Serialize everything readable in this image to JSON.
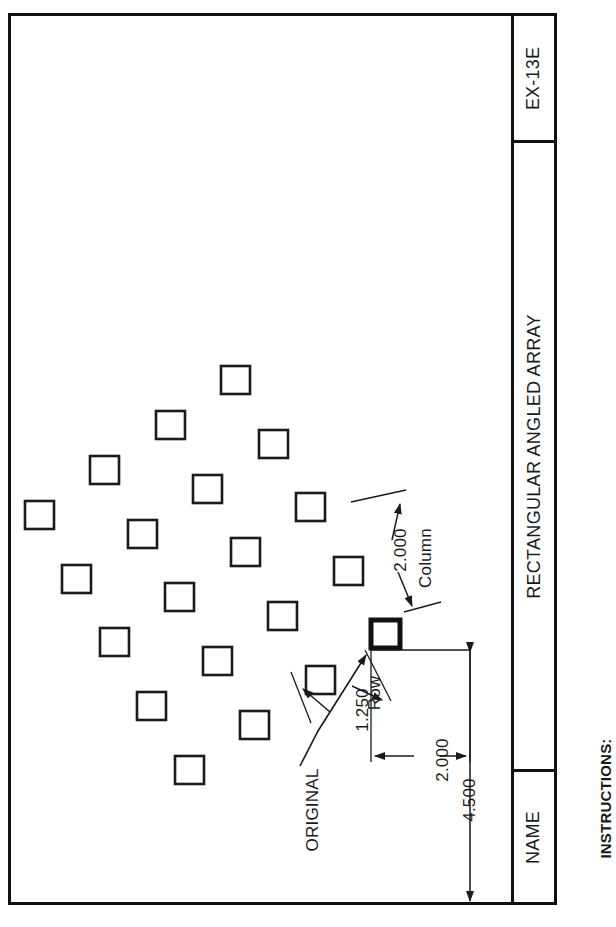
{
  "sheet": {
    "title_block": {
      "drawing_number": "EX-13E",
      "drawing_title": "RECTANGULAR ANGLED ARRAY",
      "name_label": "NAME"
    },
    "instructions_label": "INSTRUCTIONS:"
  },
  "annotations": {
    "original_label": "ORIGINAL",
    "column_spacing": "2.000",
    "column_word": "Column",
    "row_spacing": "1.250",
    "row_word": "Row",
    "offset_dimension": "2.000",
    "overall_dimension": "4.500"
  },
  "chart_data": {
    "type": "scatter",
    "title": "RECTANGULAR ANGLED ARRAY",
    "xlabel": "",
    "ylabel": "",
    "array": {
      "rows": 4,
      "columns": 5,
      "row_spacing": 1.25,
      "column_spacing": 2.0,
      "base_point": "ORIGINAL",
      "angle_note": "array rotated / angled relative to sheet axes"
    },
    "squares_px": [
      {
        "x": 371,
        "y": 620,
        "w": 29,
        "h": 28,
        "role": "original"
      },
      {
        "x": 306,
        "y": 666,
        "w": 29,
        "h": 28,
        "role": "copy"
      },
      {
        "x": 240,
        "y": 711,
        "w": 29,
        "h": 28,
        "role": "copy"
      },
      {
        "x": 175,
        "y": 756,
        "w": 29,
        "h": 28,
        "role": "copy"
      },
      {
        "x": 334,
        "y": 557,
        "w": 29,
        "h": 28,
        "role": "copy"
      },
      {
        "x": 268,
        "y": 602,
        "w": 29,
        "h": 28,
        "role": "copy"
      },
      {
        "x": 203,
        "y": 647,
        "w": 29,
        "h": 28,
        "role": "copy"
      },
      {
        "x": 137,
        "y": 692,
        "w": 29,
        "h": 28,
        "role": "copy"
      },
      {
        "x": 296,
        "y": 493,
        "w": 29,
        "h": 28,
        "role": "copy"
      },
      {
        "x": 231,
        "y": 538,
        "w": 29,
        "h": 28,
        "role": "copy"
      },
      {
        "x": 165,
        "y": 583,
        "w": 29,
        "h": 28,
        "role": "copy"
      },
      {
        "x": 100,
        "y": 628,
        "w": 29,
        "h": 28,
        "role": "copy"
      },
      {
        "x": 259,
        "y": 430,
        "w": 29,
        "h": 28,
        "role": "copy"
      },
      {
        "x": 193,
        "y": 475,
        "w": 29,
        "h": 28,
        "role": "copy"
      },
      {
        "x": 128,
        "y": 520,
        "w": 29,
        "h": 28,
        "role": "copy"
      },
      {
        "x": 62,
        "y": 565,
        "w": 29,
        "h": 28,
        "role": "copy"
      },
      {
        "x": 221,
        "y": 366,
        "w": 29,
        "h": 28,
        "role": "copy"
      },
      {
        "x": 156,
        "y": 411,
        "w": 29,
        "h": 28,
        "role": "copy"
      },
      {
        "x": 90,
        "y": 456,
        "w": 29,
        "h": 28,
        "role": "copy"
      },
      {
        "x": 25,
        "y": 501,
        "w": 29,
        "h": 28,
        "role": "copy"
      }
    ]
  }
}
